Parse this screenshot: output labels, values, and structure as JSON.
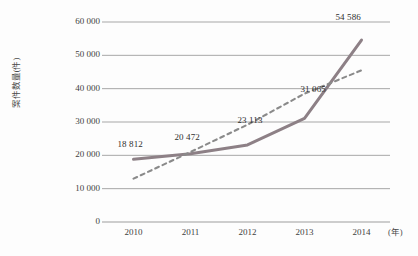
{
  "chart_data": {
    "type": "line",
    "title": "",
    "subtitle": "",
    "xlabel": "(年)",
    "ylabel": "案件数量(件)",
    "categories": [
      "2010",
      "2011",
      "2012",
      "2013",
      "2014"
    ],
    "series": [
      {
        "name": "案件数量",
        "style": "solid",
        "color": "#8d8086",
        "values": [
          18812,
          20472,
          23113,
          31065,
          54586
        ],
        "value_labels": [
          "18 812",
          "20 472",
          "23 113",
          "31 065",
          "54 586"
        ]
      },
      {
        "name": "趋势线",
        "style": "dashed",
        "color": "#8a8a8a",
        "values": [
          13000,
          21000,
          29200,
          38500,
          45500
        ]
      }
    ],
    "ylim": [
      0,
      60000
    ],
    "yticks": [
      0,
      10000,
      20000,
      30000,
      40000,
      50000,
      60000
    ],
    "ytick_labels": [
      "0",
      "10 000",
      "20 000",
      "30 000",
      "40 000",
      "50 000",
      "60 000"
    ],
    "grid": "horizontal",
    "legend": "none"
  },
  "axes": {
    "y_title": "案件数量(件)",
    "x_unit": "(年)"
  },
  "caption": {
    "cutoff_text": ""
  }
}
